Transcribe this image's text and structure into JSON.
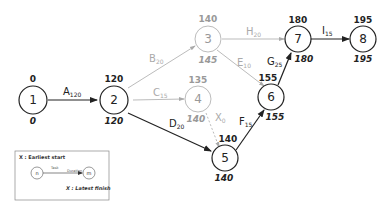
{
  "colors": {
    "critical": "#222222",
    "noncritical": "#aaaaaa",
    "legend_border": "#888888"
  },
  "nodes": [
    {
      "id": "1",
      "label": "1",
      "earliest_start": "0",
      "latest_finish": "0",
      "critical": true
    },
    {
      "id": "2",
      "label": "2",
      "earliest_start": "120",
      "latest_finish": "120",
      "critical": true
    },
    {
      "id": "3",
      "label": "3",
      "earliest_start": "140",
      "latest_finish": "145",
      "critical": false
    },
    {
      "id": "4",
      "label": "4",
      "earliest_start": "135",
      "latest_finish": "140",
      "critical": false
    },
    {
      "id": "5",
      "label": "5",
      "earliest_start": "140",
      "latest_finish": "140",
      "critical": true
    },
    {
      "id": "6",
      "label": "6",
      "earliest_start": "155",
      "latest_finish": "155",
      "critical": true
    },
    {
      "id": "7",
      "label": "7",
      "earliest_start": "180",
      "latest_finish": "180",
      "critical": true
    },
    {
      "id": "8",
      "label": "8",
      "earliest_start": "195",
      "latest_finish": "195",
      "critical": true
    }
  ],
  "tasks": [
    {
      "name": "A",
      "duration": "120",
      "from": "1",
      "to": "2",
      "critical": true
    },
    {
      "name": "B",
      "duration": "20",
      "from": "2",
      "to": "3",
      "critical": false
    },
    {
      "name": "C",
      "duration": "15",
      "from": "2",
      "to": "4",
      "critical": false
    },
    {
      "name": "D",
      "duration": "20",
      "from": "2",
      "to": "5",
      "critical": true
    },
    {
      "name": "X",
      "duration": "0",
      "from": "4",
      "to": "5",
      "critical": false,
      "dummy": true
    },
    {
      "name": "E",
      "duration": "10",
      "from": "3",
      "to": "6",
      "critical": false
    },
    {
      "name": "F",
      "duration": "15",
      "from": "5",
      "to": "6",
      "critical": true
    },
    {
      "name": "H",
      "duration": "20",
      "from": "3",
      "to": "7",
      "critical": false
    },
    {
      "name": "G",
      "duration": "25",
      "from": "6",
      "to": "7",
      "critical": true
    },
    {
      "name": "I",
      "duration": "15",
      "from": "7",
      "to": "8",
      "critical": true
    }
  ],
  "legend": {
    "earliest_start": "X : Earliest start",
    "latest_finish": "X : Latest finish",
    "node_from": "n",
    "node_to": "m",
    "task_label": "Task",
    "duration_label": "Duration"
  }
}
